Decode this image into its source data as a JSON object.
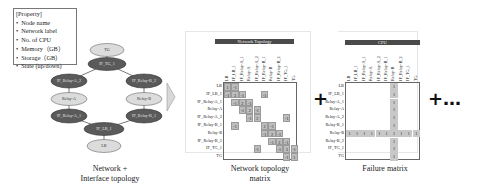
{
  "property_box": {
    "title": "[Property]",
    "items": [
      "Node name",
      "Network label",
      "No. of CPU",
      "Memory（GB）",
      "Storage（GB）",
      "State (up/down)"
    ]
  },
  "graph": {
    "nodes": {
      "TG": "TG",
      "IF_TG_1": "IF_TG_1",
      "IF_RA_2": "IF_Relay-A_2",
      "IF_RB_2": "IF_Relay-B_2",
      "RA": "Relay-A",
      "RB": "Relay-B",
      "IF_RA_1": "IF_Relay-A_1",
      "IF_RB_1": "IF_Relay-B_1",
      "IF_LB_1": "IF_LB_1",
      "LB": "LB"
    },
    "caption_line1": "Network +",
    "caption_line2": "Interface topology"
  },
  "topology_matrix": {
    "title": "Network Topology",
    "labels": [
      "LB",
      "IF_LB_1",
      "IF_Relay-A_1",
      "Relay-A",
      "IF_Relay-A_2",
      "IF_Relay-B_1",
      "Relay-B",
      "IF_Relay-B_2",
      "IF_TG_1",
      "TG"
    ],
    "values": [
      [
        1,
        -1,
        0,
        0,
        0,
        0,
        0,
        0,
        0,
        0
      ],
      [
        -1,
        3,
        -1,
        0,
        0,
        -1,
        0,
        0,
        0,
        0
      ],
      [
        0,
        -1,
        2,
        -1,
        0,
        0,
        0,
        0,
        0,
        0
      ],
      [
        0,
        0,
        -1,
        2,
        -1,
        0,
        0,
        0,
        0,
        0
      ],
      [
        0,
        0,
        0,
        -1,
        2,
        0,
        0,
        0,
        -1,
        0
      ],
      [
        0,
        -1,
        0,
        0,
        0,
        2,
        -1,
        0,
        0,
        0
      ],
      [
        0,
        0,
        0,
        0,
        0,
        -1,
        2,
        -1,
        0,
        0
      ],
      [
        0,
        0,
        0,
        0,
        0,
        0,
        -1,
        2,
        -1,
        0
      ],
      [
        0,
        0,
        0,
        0,
        -1,
        0,
        0,
        -1,
        3,
        -1
      ],
      [
        0,
        0,
        0,
        0,
        0,
        0,
        0,
        0,
        -1,
        1
      ]
    ],
    "caption_line1": "Network topology",
    "caption_line2": "matrix"
  },
  "failure_matrix": {
    "title": "CPU",
    "col_labels": [
      "LB",
      "IF_LB_1",
      "IF_Relay-A_1",
      "Relay-A",
      "IF_Relay-A_2",
      "IF_Relay-B_1",
      "Relay-B",
      "IF_Relay-B_2",
      "IF_TG_1",
      "TG"
    ],
    "row_labels": [
      "LB",
      "IF_LB_1",
      "Relay-A_1",
      "Relay-A",
      "Relay-A_2",
      "Relay-B_1",
      "Relay-B",
      "Relay-B_2",
      "IF_TG_1",
      "TG"
    ],
    "failed_index": 6,
    "cell_value": "1",
    "caption": "Failure matrix"
  },
  "operators": {
    "plus": "+",
    "plus_more": "+…"
  }
}
